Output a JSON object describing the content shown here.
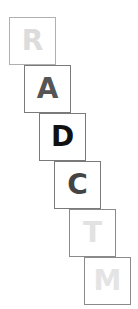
{
  "tiles": [
    {
      "letter": "R",
      "color": "#dcdcdc",
      "border": "#b0b0b0"
    },
    {
      "letter": "A",
      "color": "#555555",
      "border": "#7a7a7a"
    },
    {
      "letter": "D",
      "color": "#111111",
      "border": "#7a7a7a"
    },
    {
      "letter": "C",
      "color": "#444444",
      "border": "#7a7a7a"
    },
    {
      "letter": "T",
      "color": "#e2e2e2",
      "border": "#8a8a8a"
    },
    {
      "letter": "M",
      "color": "#e4e4e4",
      "border": "#8a8a8a"
    }
  ]
}
